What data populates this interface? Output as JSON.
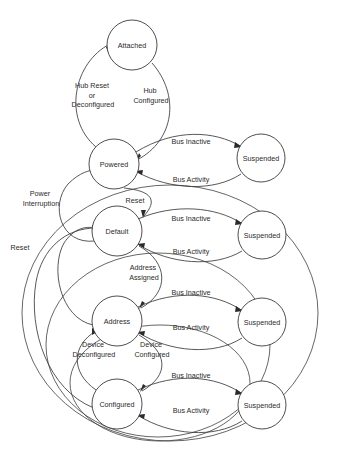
{
  "diagram": {
    "type": "state-machine",
    "background_color": "#ffffff",
    "line_color": "#3a3a3a",
    "text_color": "#2b2b2b",
    "states": [
      {
        "id": "attached",
        "label": "Attached",
        "cx": 132,
        "cy": 45,
        "r": 25
      },
      {
        "id": "powered",
        "label": "Powered",
        "cx": 114,
        "cy": 164,
        "r": 25
      },
      {
        "id": "default",
        "label": "Default",
        "cx": 117,
        "cy": 231,
        "r": 25
      },
      {
        "id": "address",
        "label": "Address",
        "cx": 117,
        "cy": 321,
        "r": 25
      },
      {
        "id": "configured",
        "label": "Configured",
        "cx": 117,
        "cy": 404,
        "r": 25
      },
      {
        "id": "susp_pow",
        "label": "Suspended",
        "cx": 261,
        "cy": 158,
        "r": 24
      },
      {
        "id": "susp_def",
        "label": "Suspended",
        "cx": 262,
        "cy": 235,
        "r": 24
      },
      {
        "id": "susp_addr",
        "label": "Suspended",
        "cx": 262,
        "cy": 322,
        "r": 24
      },
      {
        "id": "susp_conf",
        "label": "Suspended",
        "cx": 262,
        "cy": 405,
        "r": 24
      }
    ],
    "transitions": [
      {
        "id": "t-hub-reset",
        "from": "attached",
        "to": "powered",
        "label_lines": [
          "Hub Reset",
          "or",
          "Deconfigured"
        ],
        "lx": 93,
        "ly": 93
      },
      {
        "id": "t-hub-configured",
        "from": "attached",
        "to": "powered",
        "label_lines": [
          "Hub",
          "Configured"
        ],
        "lx": 151,
        "ly": 96
      },
      {
        "id": "t-pow-inactive",
        "from": "powered",
        "to": "susp_pow",
        "label_lines": [
          "Bus Inactive"
        ],
        "lx": 191,
        "ly": 142
      },
      {
        "id": "t-pow-activity",
        "from": "susp_pow",
        "to": "powered",
        "label_lines": [
          "Bus Activity"
        ],
        "lx": 191,
        "ly": 178
      },
      {
        "id": "t-power-interrupt",
        "from": "default",
        "to": "powered",
        "label_lines": [
          "Power",
          "Interruption"
        ],
        "lx": 41,
        "ly": 198
      },
      {
        "id": "t-reset-left",
        "from": "configured",
        "to": "default",
        "label_lines": [
          "Reset"
        ],
        "lx": 20,
        "ly": 248
      },
      {
        "id": "t-reset-top",
        "from": "powered",
        "to": "default",
        "label_lines": [
          "Reset"
        ],
        "lx": 133,
        "ly": 200
      },
      {
        "id": "t-def-inactive",
        "from": "default",
        "to": "susp_def",
        "label_lines": [
          "Bus Inactive"
        ],
        "lx": 191,
        "ly": 219
      },
      {
        "id": "t-def-activity",
        "from": "susp_def",
        "to": "default",
        "label_lines": [
          "Bus Activity"
        ],
        "lx": 191,
        "ly": 251
      },
      {
        "id": "t-address-assigned",
        "from": "default",
        "to": "address",
        "label_lines": [
          "Address",
          "Assigned"
        ],
        "lx": 144,
        "ly": 272
      },
      {
        "id": "t-addr-inactive",
        "from": "address",
        "to": "susp_addr",
        "label_lines": [
          "Bus Inactive"
        ],
        "lx": 191,
        "ly": 293
      },
      {
        "id": "t-addr-activity",
        "from": "susp_addr",
        "to": "address",
        "label_lines": [
          "Bus Activity"
        ],
        "lx": 191,
        "ly": 327
      },
      {
        "id": "t-dev-deconf",
        "from": "configured",
        "to": "address",
        "label_lines": [
          "Device",
          "Deconfigured"
        ],
        "lx": 95,
        "ly": 349
      },
      {
        "id": "t-dev-conf",
        "from": "address",
        "to": "configured",
        "label_lines": [
          "Device",
          "Configured"
        ],
        "lx": 151,
        "ly": 349
      },
      {
        "id": "t-conf-inactive",
        "from": "configured",
        "to": "susp_conf",
        "label_lines": [
          "Bus Inactive"
        ],
        "lx": 191,
        "ly": 376
      },
      {
        "id": "t-conf-activity",
        "from": "susp_conf",
        "to": "configured",
        "label_lines": [
          "Bus Activity"
        ],
        "lx": 191,
        "ly": 410
      }
    ]
  }
}
